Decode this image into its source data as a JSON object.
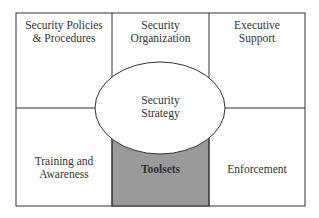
{
  "diagram": {
    "cells": [
      {
        "id": "policies",
        "label_line1": "Security Policies",
        "label_line2": "& Procedures"
      },
      {
        "id": "organization",
        "label_line1": "Security",
        "label_line2": "Organization"
      },
      {
        "id": "executive",
        "label_line1": "Executive",
        "label_line2": "Support"
      },
      {
        "id": "training",
        "label_line1": "Training and",
        "label_line2": "Awareness"
      },
      {
        "id": "toolsets",
        "label_line1": "Toolsets",
        "label_line2": ""
      },
      {
        "id": "enforcement",
        "label_line1": "Enforcement",
        "label_line2": ""
      }
    ],
    "center": {
      "label_line1": "Security",
      "label_line2": "Strategy"
    },
    "colors": {
      "border": "#333333",
      "highlight_fill": "#9a9a9a",
      "background": "#ffffff"
    }
  }
}
